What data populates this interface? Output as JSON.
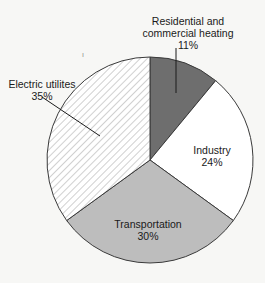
{
  "chart_data": {
    "type": "pie",
    "title": "",
    "start": "top",
    "direction": "clockwise",
    "slices": [
      {
        "label_lines": [
          "Residential and",
          "commercial heating",
          "11%"
        ],
        "name": "Residential and commercial heating",
        "value": 11,
        "fill": "#6e6e6e",
        "pattern": "solid"
      },
      {
        "label_lines": [
          "Industry",
          "24%"
        ],
        "name": "Industry",
        "value": 24,
        "fill": "#ffffff",
        "pattern": "solid"
      },
      {
        "label_lines": [
          "Transportation",
          "30%"
        ],
        "name": "Transportation",
        "value": 30,
        "fill": "#bdbdbd",
        "pattern": "solid"
      },
      {
        "label_lines": [
          "Electric utilites",
          "35%"
        ],
        "name": "Electric utilites",
        "value": 35,
        "fill": "#ffffff",
        "pattern": "diagonal-hatch"
      }
    ],
    "label_placement": {
      "Residential and commercial heating": "outside-top-with-leader",
      "Industry": "inside",
      "Transportation": "inside",
      "Electric utilites": "outside-left-with-leader"
    },
    "units": "%"
  },
  "stray_mark": "ı"
}
